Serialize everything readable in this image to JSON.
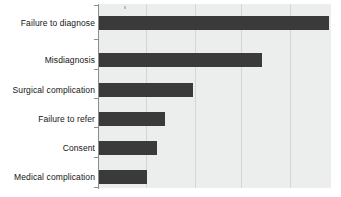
{
  "chart_data": {
    "type": "bar",
    "orientation": "horizontal",
    "title": "",
    "subtitle": "",
    "xlabel": "",
    "ylabel": "",
    "categories": [
      "Failure to diagnose",
      "Misdiagnosis",
      "Surgical complication",
      "Failure to refer",
      "Consent",
      "Medical complication"
    ],
    "values": [
      100,
      71,
      41,
      29,
      25,
      21
    ],
    "xlim": [
      0,
      100
    ],
    "ylim": [
      0,
      6
    ],
    "xticks": [],
    "yticks": [
      "Failure to diagnose",
      "Misdiagnosis",
      "Surgical complication",
      "Failure to refer",
      "Consent",
      "Medical complication"
    ],
    "gridlines": {
      "vertical": true,
      "horizontal": false,
      "vertical_positions": [
        20,
        41,
        61,
        82
      ]
    },
    "legend": {
      "show": false,
      "position": "none"
    },
    "bar_color": "#3a3a3a",
    "plot_background": "#eceded",
    "grid_color": "#d3d5d6",
    "axis_color": "#8a8c8e"
  },
  "bars": [
    {
      "label": "Failure to diagnose",
      "value": 100,
      "pixel_width": 230,
      "top": 16
    },
    {
      "label": "Misdiagnosis",
      "value": 71,
      "pixel_width": 163,
      "top": 53
    },
    {
      "label": "Surgical complication",
      "value": 41,
      "pixel_width": 94,
      "top": 83
    },
    {
      "label": "Failure to refer",
      "value": 29,
      "pixel_width": 66,
      "top": 112
    },
    {
      "label": "Consent",
      "value": 25,
      "pixel_width": 58,
      "top": 141
    },
    {
      "label": "Medical complication",
      "value": 21,
      "pixel_width": 48,
      "top": 170
    }
  ]
}
